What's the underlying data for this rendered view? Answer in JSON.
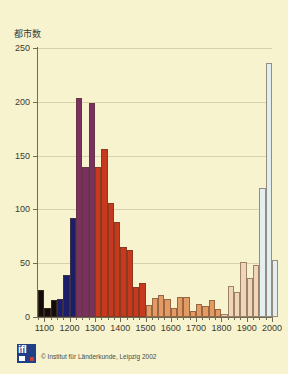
{
  "figure": {
    "background_color": "#f7f3cf",
    "plot_background_color": "#faf7d8"
  },
  "credit": {
    "logo_text": "ifl",
    "text": "© Institut für Länderkunde, Leipzig 2002"
  },
  "chart_data": {
    "type": "bar",
    "title": "",
    "subtitle": "",
    "xlabel": "",
    "ylabel": "都市数",
    "xlim": [
      1075,
      2000
    ],
    "ylim": [
      0,
      250
    ],
    "bin_width": 25,
    "grid": true,
    "grid_axis": "y",
    "legend": "none",
    "y_ticks": [
      0,
      50,
      100,
      150,
      200,
      250
    ],
    "y_tick_labels": [
      "0",
      "50",
      "100",
      "150",
      "200",
      "250"
    ],
    "x_ticks": [
      1100,
      1200,
      1300,
      1400,
      1500,
      1600,
      1700,
      1800,
      1900,
      2000
    ],
    "x_tick_labels": [
      "1100",
      "1200",
      "1300",
      "1400",
      "1500",
      "1600",
      "1700",
      "1800",
      "1900",
      "2000"
    ],
    "x_minor_tick_step": 25,
    "colors": {
      "black": "#100d0c",
      "navy": "#1b1f6b",
      "purple": "#7b2f62",
      "red": "#c8381c",
      "orange": "#e39a63",
      "pale_orange": "#f0d6b8",
      "pale_blue": "#e2eef0"
    },
    "bars": [
      {
        "bin_start": 1075,
        "bin_end": 1100,
        "value": 25,
        "color": "#100d0c"
      },
      {
        "bin_start": 1100,
        "bin_end": 1125,
        "value": 8,
        "color": "#100d0c"
      },
      {
        "bin_start": 1125,
        "bin_end": 1150,
        "value": 16,
        "color": "#100d0c"
      },
      {
        "bin_start": 1150,
        "bin_end": 1175,
        "value": 17,
        "color": "#1b1f6b"
      },
      {
        "bin_start": 1175,
        "bin_end": 1200,
        "value": 39,
        "color": "#1b1f6b"
      },
      {
        "bin_start": 1200,
        "bin_end": 1225,
        "value": 92,
        "color": "#1b1f6b"
      },
      {
        "bin_start": 1225,
        "bin_end": 1250,
        "value": 204,
        "color": "#7b2f62"
      },
      {
        "bin_start": 1250,
        "bin_end": 1275,
        "value": 139,
        "color": "#7b2f62"
      },
      {
        "bin_start": 1275,
        "bin_end": 1300,
        "value": 199,
        "color": "#7b2f62"
      },
      {
        "bin_start": 1300,
        "bin_end": 1325,
        "value": 139,
        "color": "#c8381c"
      },
      {
        "bin_start": 1325,
        "bin_end": 1350,
        "value": 156,
        "color": "#c8381c"
      },
      {
        "bin_start": 1350,
        "bin_end": 1375,
        "value": 106,
        "color": "#c8381c"
      },
      {
        "bin_start": 1375,
        "bin_end": 1400,
        "value": 88,
        "color": "#c8381c"
      },
      {
        "bin_start": 1400,
        "bin_end": 1425,
        "value": 65,
        "color": "#c8381c"
      },
      {
        "bin_start": 1425,
        "bin_end": 1450,
        "value": 62,
        "color": "#c8381c"
      },
      {
        "bin_start": 1450,
        "bin_end": 1475,
        "value": 28,
        "color": "#c8381c"
      },
      {
        "bin_start": 1475,
        "bin_end": 1500,
        "value": 32,
        "color": "#c8381c"
      },
      {
        "bin_start": 1500,
        "bin_end": 1525,
        "value": 11,
        "color": "#e39a63"
      },
      {
        "bin_start": 1525,
        "bin_end": 1550,
        "value": 18,
        "color": "#e39a63"
      },
      {
        "bin_start": 1550,
        "bin_end": 1575,
        "value": 20,
        "color": "#e39a63"
      },
      {
        "bin_start": 1575,
        "bin_end": 1600,
        "value": 17,
        "color": "#e39a63"
      },
      {
        "bin_start": 1600,
        "bin_end": 1625,
        "value": 8,
        "color": "#e39a63"
      },
      {
        "bin_start": 1625,
        "bin_end": 1650,
        "value": 19,
        "color": "#e39a63"
      },
      {
        "bin_start": 1650,
        "bin_end": 1675,
        "value": 19,
        "color": "#e39a63"
      },
      {
        "bin_start": 1675,
        "bin_end": 1700,
        "value": 6,
        "color": "#e39a63"
      },
      {
        "bin_start": 1700,
        "bin_end": 1725,
        "value": 12,
        "color": "#e39a63"
      },
      {
        "bin_start": 1725,
        "bin_end": 1750,
        "value": 10,
        "color": "#e39a63"
      },
      {
        "bin_start": 1750,
        "bin_end": 1775,
        "value": 16,
        "color": "#e39a63"
      },
      {
        "bin_start": 1775,
        "bin_end": 1800,
        "value": 7,
        "color": "#e39a63"
      },
      {
        "bin_start": 1800,
        "bin_end": 1825,
        "value": 3,
        "color": "#f0d6b8"
      },
      {
        "bin_start": 1825,
        "bin_end": 1850,
        "value": 29,
        "color": "#f0d6b8"
      },
      {
        "bin_start": 1850,
        "bin_end": 1875,
        "value": 23,
        "color": "#f0d6b8"
      },
      {
        "bin_start": 1875,
        "bin_end": 1900,
        "value": 51,
        "color": "#f0d6b8"
      },
      {
        "bin_start": 1900,
        "bin_end": 1925,
        "value": 36,
        "color": "#f0d6b8"
      },
      {
        "bin_start": 1925,
        "bin_end": 1950,
        "value": 48,
        "color": "#f0d6b8"
      },
      {
        "bin_start": 1950,
        "bin_end": 1975,
        "value": 120,
        "color": "#e2eef0"
      },
      {
        "bin_start": 1975,
        "bin_end": 2000,
        "value": 236,
        "color": "#e2eef0"
      },
      {
        "bin_start": 2000,
        "bin_end": 2025,
        "value": 53,
        "color": "#e2eef0"
      }
    ]
  }
}
